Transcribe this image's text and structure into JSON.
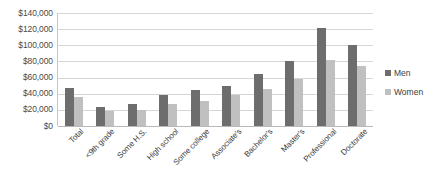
{
  "chart_data": {
    "type": "bar",
    "title": "",
    "subtitle": "",
    "xlabel": "",
    "ylabel": "",
    "ylim": [
      0,
      140000
    ],
    "ytick_step": 20000,
    "ytick_labels": [
      "$140,000",
      "$120,000",
      "$100,000",
      "$80,000",
      "$60,000",
      "$40,000",
      "$20,000",
      "$0"
    ],
    "ytick_values": [
      140000,
      120000,
      100000,
      80000,
      60000,
      40000,
      20000,
      0
    ],
    "grid": true,
    "legend_position": "right",
    "categories": [
      "Total",
      "<9th grade",
      "Some H.S.",
      "High school",
      "Some college",
      "Associate's",
      "Bachelor's",
      "Master's",
      "Professional",
      "Doctorate"
    ],
    "series": [
      {
        "name": "Men",
        "color": "#6d6d6d",
        "values": [
          47000,
          24000,
          27000,
          38000,
          45000,
          50000,
          65000,
          80000,
          122000,
          100000
        ]
      },
      {
        "name": "Women",
        "color": "#c0c0c0",
        "values": [
          36000,
          18000,
          19500,
          27000,
          31000,
          38000,
          46000,
          58000,
          82000,
          74000
        ]
      }
    ]
  },
  "colors": {
    "men": "#6d6d6d",
    "women": "#c0c0c0",
    "gridline": "#d6d6d6",
    "axis": "#b9b9b9",
    "background": "#ffffff",
    "text": "#3c3c3c"
  }
}
